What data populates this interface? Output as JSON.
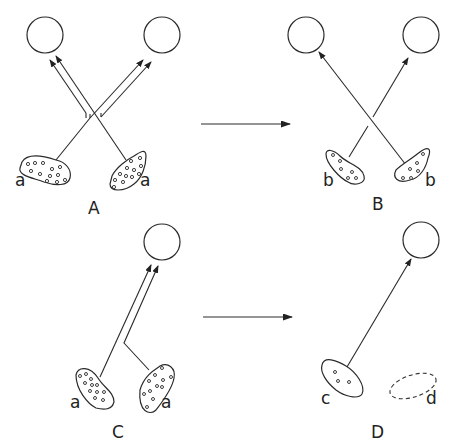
{
  "figure": {
    "type": "neural synaptic competition schematic",
    "panels": [
      {
        "id": "A",
        "label": "A",
        "input_labels": [
          "a",
          "a"
        ],
        "description": "Two input groups each send doubled axons to both target cells (crossed)"
      },
      {
        "id": "B",
        "label": "B",
        "input_labels": [
          "b",
          "b"
        ],
        "description": "Each input group retains single axon to one target cell (crossed)"
      },
      {
        "id": "C",
        "label": "C",
        "input_labels": [
          "a",
          "a"
        ],
        "description": "Two input groups both send axons to a single target cell"
      },
      {
        "id": "D",
        "label": "D",
        "input_labels": [
          "c",
          "d"
        ],
        "description": "One input group (c) retains connection; other (d) eliminated (dashed)"
      }
    ],
    "transition_arrows": [
      {
        "from": "A",
        "to": "B"
      },
      {
        "from": "C",
        "to": "D"
      }
    ],
    "colors": {
      "ink": "#2a2a2a",
      "background": "#ffffff"
    }
  }
}
